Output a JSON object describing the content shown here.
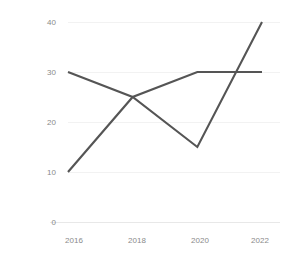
{
  "chart_data": {
    "type": "line",
    "title": "",
    "subtitle": "",
    "xlabel": "",
    "ylabel": "",
    "x": [
      2016,
      2018,
      2020,
      2022
    ],
    "xtick_labels": [
      "2016",
      "2018",
      "2020",
      "2022"
    ],
    "ytick_labels": [
      "0",
      "10",
      "20",
      "30",
      "40"
    ],
    "ytick_values": [
      0,
      10,
      20,
      30,
      40
    ],
    "ylim": [
      0,
      40
    ],
    "xlim": [
      2016,
      2022
    ],
    "grid": true,
    "grid_axis": "y",
    "legend": false,
    "legend_position": "none",
    "series": [
      {
        "name": "series-1",
        "values": [
          30,
          25,
          15,
          40
        ],
        "color": "#555555"
      },
      {
        "name": "series-2",
        "values": [
          10,
          25,
          30,
          30
        ],
        "color": "#555555"
      }
    ]
  },
  "style": {
    "background": "#ffffff",
    "line_color": "#555555",
    "grid_color": "#f2f2f2",
    "axis_color": "#e8e8e8",
    "tick_label_color": "#8a8a8a"
  },
  "geometry": {
    "plot_left": 68,
    "plot_right": 262,
    "plot_top": 22,
    "plot_bottom": 222
  }
}
